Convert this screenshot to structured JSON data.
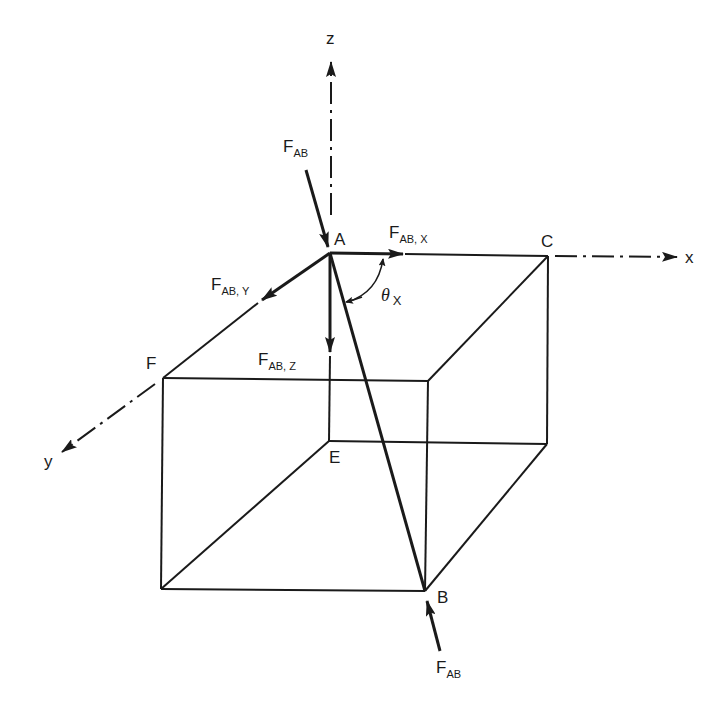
{
  "figure": {
    "type": "3D force-component diagram (rectangular box, member AB)",
    "points": {
      "A": "A",
      "B": "B",
      "C": "C",
      "E": "E",
      "F": "F"
    },
    "axes": {
      "x": "x",
      "y": "y",
      "z": "z"
    },
    "forces": {
      "top": {
        "main": "F",
        "sub": "AB"
      },
      "bottom": {
        "main": "F",
        "sub": "AB"
      },
      "x_component": {
        "main": "F",
        "sub": "AB, X"
      },
      "y_component": {
        "main": "F",
        "sub": "AB, Y"
      },
      "z_component": {
        "main": "F",
        "sub": "AB, Z"
      }
    },
    "angle": {
      "symbol": "θ",
      "sub": "X"
    }
  }
}
